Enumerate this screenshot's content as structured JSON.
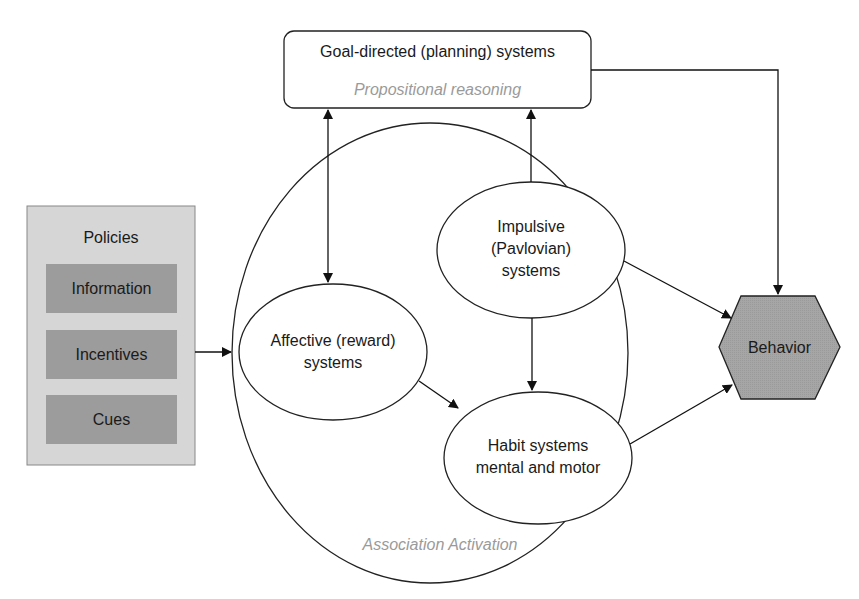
{
  "diagram": {
    "colors": {
      "line": "#222222",
      "policies_panel": "#d6d6d6",
      "policy_item": "#9c9c9c",
      "behavior_fill": "#a2a2a2",
      "caption_gray": "#9a9a9a"
    },
    "goal_box": {
      "title": "Goal-directed (planning) systems",
      "subtitle": "Propositional reasoning"
    },
    "policies": {
      "title": "Policies",
      "items": [
        {
          "label": "Information"
        },
        {
          "label": "Incentives"
        },
        {
          "label": "Cues"
        }
      ]
    },
    "association_circle": {
      "caption": "Association Activation"
    },
    "nodes": {
      "affective": {
        "line1": "Affective (reward)",
        "line2": "systems"
      },
      "impulsive": {
        "line1": "Impulsive",
        "line2": "(Pavlovian)",
        "line3": "systems"
      },
      "habit": {
        "line1": "Habit systems",
        "line2": "mental and motor"
      },
      "behavior": {
        "label": "Behavior"
      }
    },
    "edges": [
      {
        "from": "policies",
        "to": "association_circle"
      },
      {
        "from": "goal_box",
        "to": "affective",
        "bidirectional": true
      },
      {
        "from": "impulsive",
        "to": "goal_box"
      },
      {
        "from": "goal_box",
        "to": "behavior"
      },
      {
        "from": "impulsive",
        "to": "behavior"
      },
      {
        "from": "impulsive",
        "to": "habit"
      },
      {
        "from": "affective",
        "to": "habit"
      },
      {
        "from": "habit",
        "to": "behavior"
      }
    ]
  }
}
